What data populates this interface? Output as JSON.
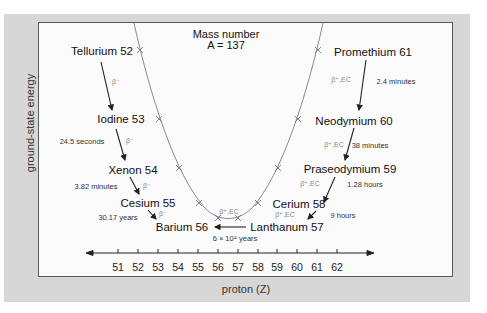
{
  "diagram": {
    "title_line1": "Mass number",
    "title_line2": "A = 137",
    "y_axis_label": "ground-state energy",
    "x_axis_label": "proton (Z)",
    "x_ticks": [
      "51",
      "52",
      "53",
      "54",
      "55",
      "56",
      "57",
      "58",
      "59",
      "60",
      "61",
      "62"
    ],
    "elements": {
      "tellurium": "Tellurium 52",
      "iodine": "Iodine 53",
      "xenon": "Xenon 54",
      "cesium": "Cesium 55",
      "barium": "Barium 56",
      "lanthanum": "Lanthanum 57",
      "cerium": "Cerium 58",
      "praseodymium": "Praseodymium 59",
      "neodymium": "Neodymium 60",
      "promethium": "Promethium 61"
    },
    "decay_modes": {
      "te_i": "β⁻",
      "i_xe": "β⁻",
      "xe_cs": "β⁻",
      "cs_ba": "β⁻",
      "pm_nd": "β⁺,EC",
      "nd_pr": "β⁺,EC",
      "pr_ce": "β⁺,EC",
      "ce_la": "β⁺,EC",
      "la_ba": "β⁺,EC"
    },
    "half_lives": {
      "iodine": "24.5 seconds",
      "xenon": "3.82 minutes",
      "cesium": "30.17 years",
      "promethium": "2.4 minutes",
      "neodymium": "38 minutes",
      "praseodymium": "1.28 hours",
      "cerium": "9 hours",
      "lanthanum": "6 × 10⁴ years"
    },
    "colors": {
      "panel": "#d7d7d7",
      "plot_bg": "#fbfbfb",
      "curve": "#8a8a8a",
      "arrows": "#222222"
    }
  }
}
